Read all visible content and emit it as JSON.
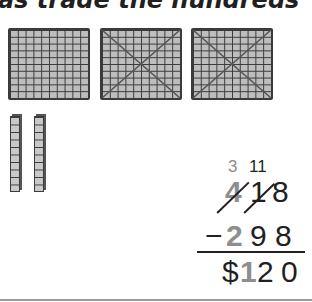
{
  "heading": {
    "text": "as trade the hundreds"
  },
  "model": {
    "hundreds_flats": [
      {
        "label": "hundred-flat",
        "crossed_out": false
      },
      {
        "label": "hundred-flat",
        "crossed_out": true
      },
      {
        "label": "hundred-flat",
        "crossed_out": true
      }
    ],
    "tens_rods": [
      {
        "label": "ten-rod"
      },
      {
        "label": "ten-rod"
      }
    ]
  },
  "problem": {
    "regroup": {
      "hundreds": "3",
      "tens": "11"
    },
    "minuend": {
      "hundreds": "4",
      "tens": "1",
      "ones": "8"
    },
    "subtrahend": {
      "sign": "−",
      "hundreds": "2",
      "tens": "9",
      "ones": "8"
    },
    "result": {
      "currency": "$",
      "hundreds": "1",
      "tens": "2",
      "ones": "0"
    }
  },
  "colors": {
    "ink": "#231f20",
    "highlight_gray": "#8e8e8e",
    "block_fill": "#bdbdbd"
  }
}
